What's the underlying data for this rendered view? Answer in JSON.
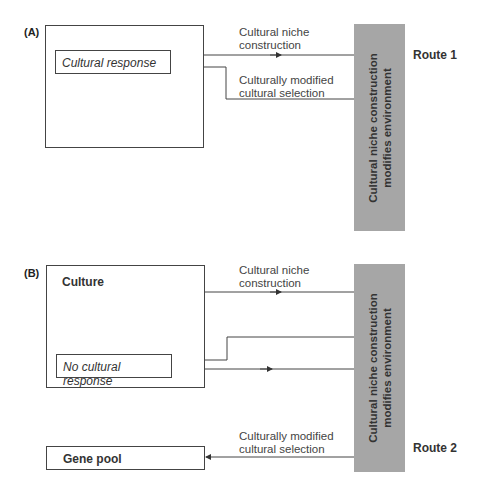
{
  "panel_a": {
    "label": "(A)",
    "inner_box": "Cultural response",
    "top_arrow_label_1": "Cultural niche",
    "top_arrow_label_2": "construction",
    "bottom_arrow_label_1": "Culturally modified",
    "bottom_arrow_label_2": "cultural selection",
    "bar_line_1": "Cultural niche construction",
    "bar_line_2": "modifies environment",
    "route": "Route 1"
  },
  "panel_b": {
    "label": "(B)",
    "outer_box_title": "Culture",
    "inner_box": "No cultural response",
    "top_arrow_label_1": "Cultural niche",
    "top_arrow_label_2": "construction",
    "bottom_arrow_label_1": "Culturally modified",
    "bottom_arrow_label_2": "cultural selection",
    "gene_pool": "Gene pool",
    "bar_line_1": "Cultural niche construction",
    "bar_line_2": "modifies environment",
    "route": "Route 2"
  },
  "colors": {
    "bar": "#a6a6a6",
    "line": "#444444"
  }
}
